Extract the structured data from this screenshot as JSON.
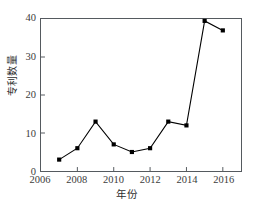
{
  "chart_data": {
    "type": "line",
    "title": "",
    "xlabel": "年份",
    "ylabel": "专利数量",
    "x": [
      2007,
      2008,
      2009,
      2010,
      2011,
      2012,
      2013,
      2014,
      2015,
      2016
    ],
    "values": [
      3,
      6,
      13,
      7,
      5,
      6,
      13,
      12,
      39.5,
      37
    ],
    "series": [
      {
        "name": "专利数量",
        "values": [
          3,
          6,
          13,
          7,
          5,
          6,
          13,
          12,
          39.5,
          37
        ]
      }
    ],
    "xlim": [
      2006,
      2017
    ],
    "ylim": [
      0,
      40
    ],
    "xticks": [
      2006,
      2008,
      2010,
      2012,
      2014,
      2016
    ],
    "xtick_labels": [
      "2006",
      "2008",
      "2010",
      "2012",
      "2014",
      "2016"
    ],
    "yticks": [
      0,
      10,
      20,
      30,
      40
    ],
    "ytick_labels": [
      "0",
      "10",
      "20",
      "30",
      "40"
    ],
    "grid": false,
    "legend": false,
    "legend_position": "none",
    "marker": "filled-square",
    "line_color": "#000000",
    "marker_color": "#000000",
    "background_color": "#ffffff",
    "frame_color": "#555a5f"
  }
}
